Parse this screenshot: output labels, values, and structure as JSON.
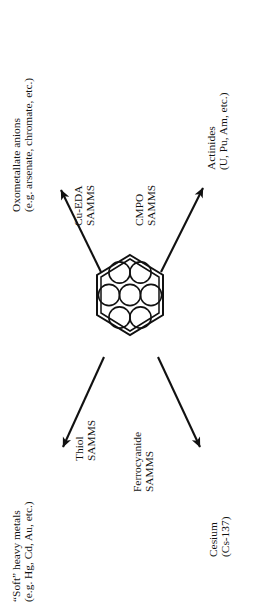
{
  "figure": {
    "type": "radial-hub-diagram",
    "orientation": "text rotated 90 degrees counter-clockwise",
    "center": {
      "name": "mesoporous-silica-hexagon",
      "description": "hexagonal pore structure with seven circular pores"
    }
  },
  "center_node": {
    "pore_count": 7,
    "outline": "double-line hexagon"
  },
  "branches": [
    {
      "id": "cu-eda",
      "direction": "up-left",
      "material": {
        "line1": "Cu-EDA",
        "line2": "SAMMS"
      },
      "target": {
        "line1": "Oxometallate anions",
        "line2": "(e.g. arsenate, chromate, etc.)"
      }
    },
    {
      "id": "cmpo",
      "direction": "up-right",
      "material": {
        "line1": "CMPO",
        "line2": "SAMMS"
      },
      "target": {
        "line1": "Actinides",
        "line2": "(U, Pu, Am, etc.)"
      }
    },
    {
      "id": "thiol",
      "direction": "down-left",
      "material": {
        "line1": "Thiol",
        "line2": "SAMMS"
      },
      "target": {
        "line1": "“Soft” heavy metals",
        "line2": "(e.g. Hg, Cd, Au, etc.)"
      }
    },
    {
      "id": "ferrocyanide",
      "direction": "down-right",
      "material": {
        "line1": "Ferrocyanide",
        "line2": "SAMMS"
      },
      "target": {
        "line1": "Cesium",
        "line2": "(Cs-137)"
      }
    }
  ],
  "colors": {
    "ink": "#111111",
    "background": "#ffffff",
    "pore_stroke": "#111111"
  }
}
